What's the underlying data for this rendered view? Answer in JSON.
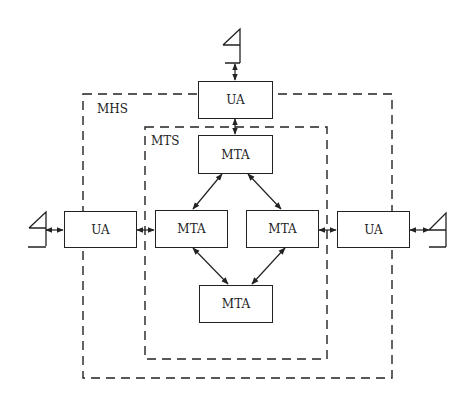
{
  "diagram": {
    "title": "",
    "regions": [
      {
        "id": "mhs",
        "label": "MHS"
      },
      {
        "id": "mts",
        "label": "MTS"
      }
    ],
    "nodes": [
      {
        "id": "ua_top",
        "label": "UA"
      },
      {
        "id": "mta_top",
        "label": "MTA"
      },
      {
        "id": "ua_left",
        "label": "UA"
      },
      {
        "id": "mta_left",
        "label": "MTA"
      },
      {
        "id": "mta_right",
        "label": "MTA"
      },
      {
        "id": "ua_right",
        "label": "UA"
      },
      {
        "id": "mta_bottom",
        "label": "MTA"
      }
    ],
    "edges": [
      {
        "from": "user_top",
        "to": "ua_top",
        "bidirectional": true
      },
      {
        "from": "ua_top",
        "to": "mta_top",
        "bidirectional": true
      },
      {
        "from": "mta_top",
        "to": "mta_left",
        "bidirectional": true
      },
      {
        "from": "mta_top",
        "to": "mta_right",
        "bidirectional": true
      },
      {
        "from": "mta_left",
        "to": "mta_bottom",
        "bidirectional": true
      },
      {
        "from": "mta_right",
        "to": "mta_bottom",
        "bidirectional": true
      },
      {
        "from": "user_left",
        "to": "ua_left",
        "bidirectional": true
      },
      {
        "from": "ua_left",
        "to": "mta_left",
        "bidirectional": true
      },
      {
        "from": "mta_right",
        "to": "ua_right",
        "bidirectional": true
      },
      {
        "from": "ua_right",
        "to": "user_right",
        "bidirectional": true
      }
    ],
    "terminals": [
      "user-top",
      "user-left",
      "user-right"
    ]
  }
}
